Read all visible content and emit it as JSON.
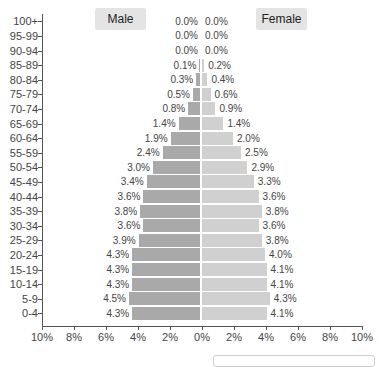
{
  "chart_data": {
    "type": "bar",
    "orientation": "horizontal",
    "subtype": "population-pyramid",
    "title": "",
    "xlabel": "",
    "ylabel": "",
    "categories": [
      "100+",
      "95-99",
      "90-94",
      "85-89",
      "80-84",
      "75-79",
      "70-74",
      "65-69",
      "60-64",
      "55-59",
      "50-54",
      "45-49",
      "40-44",
      "35-39",
      "30-34",
      "25-29",
      "20-24",
      "15-19",
      "10-14",
      "5-9",
      "0-4"
    ],
    "series": [
      {
        "name": "Male",
        "color": "#a9a9a9",
        "values": [
          0.0,
          0.0,
          0.0,
          0.1,
          0.3,
          0.5,
          0.8,
          1.4,
          1.9,
          2.4,
          3.0,
          3.4,
          3.6,
          3.8,
          3.6,
          3.9,
          4.3,
          4.3,
          4.3,
          4.5,
          4.3
        ],
        "labels": [
          "0.0%",
          "0.0%",
          "0.0%",
          "0.1%",
          "0.3%",
          "0.5%",
          "0.8%",
          "1.4%",
          "1.9%",
          "2.4%",
          "3.0%",
          "3.4%",
          "3.6%",
          "3.8%",
          "3.6%",
          "3.9%",
          "4.3%",
          "4.3%",
          "4.3%",
          "4.5%",
          "4.3%"
        ]
      },
      {
        "name": "Female",
        "color": "#d0d0d0",
        "values": [
          0.0,
          0.0,
          0.0,
          0.2,
          0.4,
          0.6,
          0.9,
          1.4,
          2.0,
          2.5,
          2.9,
          3.3,
          3.6,
          3.8,
          3.6,
          3.8,
          4.0,
          4.1,
          4.1,
          4.3,
          4.1
        ],
        "labels": [
          "0.0%",
          "0.0%",
          "0.0%",
          "0.2%",
          "0.4%",
          "0.6%",
          "0.9%",
          "1.4%",
          "2.0%",
          "2.5%",
          "2.9%",
          "3.3%",
          "3.6%",
          "3.8%",
          "3.6%",
          "3.8%",
          "4.0%",
          "4.1%",
          "4.1%",
          "4.3%",
          "4.1%"
        ]
      }
    ],
    "xticks": [
      "10%",
      "8%",
      "6%",
      "4%",
      "2%",
      "0%",
      "2%",
      "4%",
      "6%",
      "8%",
      "10%"
    ],
    "xlim": [
      -10,
      10
    ],
    "grid": false,
    "legend": {
      "position": "top",
      "entries": [
        "Male",
        "Female"
      ]
    }
  },
  "legend": {
    "male_label": "Male",
    "female_label": "Female"
  }
}
